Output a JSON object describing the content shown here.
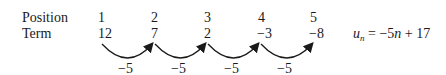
{
  "row_labels": {
    "position": "Position",
    "term": "Term"
  },
  "positions": [
    "1",
    "2",
    "3",
    "4",
    "5"
  ],
  "terms": [
    "12",
    "7",
    "2",
    "−3",
    "−8"
  ],
  "differences": [
    "−5",
    "−5",
    "−5",
    "−5"
  ],
  "formula": {
    "lhs": "u",
    "sub": "n",
    "rhs": "= −5",
    "var": "n",
    "tail": "+ 17"
  }
}
